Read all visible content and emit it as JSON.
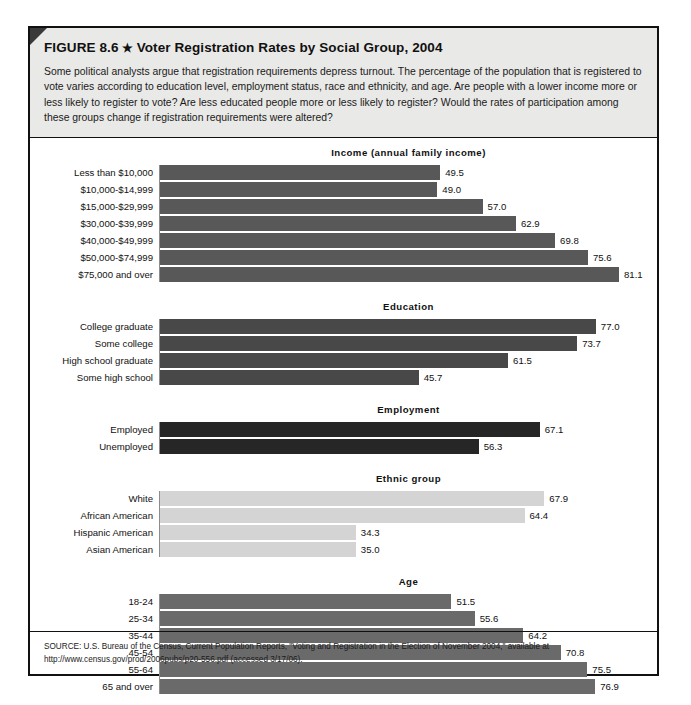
{
  "figure": {
    "label": "FIGURE 8.6",
    "star": "★",
    "title": "Voter Registration Rates by Social Group, 2004",
    "caption": "Some political analysts argue that registration requirements depress turnout. The percentage of the population that is registered to vote varies according to education level, employment status, race and ethnicity, and age. Are people with a lower income more or less likely to register to vote? Are less educated people more or less likely to register? Would the rates of participation among these groups change if registration requirements were altered?",
    "source": "SOURCE: U.S. Bureau of the Census, Current Population Reports, \"Voting and Registration in the Election of November 2004,\" available at http://www.census.gov/prod/2006pubs/p20-556.pdf (accessed 3/17/06)."
  },
  "colors": {
    "income_bar": "#585858",
    "education_bar": "#484848",
    "employment_bar": "#262626",
    "ethnic_bar": "#d4d4d4",
    "age_bar": "#6a6a6a",
    "header_bg": "#e9e9e7",
    "border": "#111111",
    "axis": "#8d8d8d"
  },
  "chart_data": {
    "type": "bar",
    "title": "Voter Registration Rates by Social Group, 2004",
    "xlabel": "",
    "ylabel": "",
    "xlim": [
      0,
      100
    ],
    "grid": false,
    "orientation": "horizontal",
    "value_unit": "percent",
    "groups": [
      {
        "name": "Income (annual family income)",
        "categories": [
          "Less than $10,000",
          "$10,000-$14,999",
          "$15,000-$29,999",
          "$30,000-$39,999",
          "$40,000-$49,999",
          "$50,000-$74,999",
          "$75,000 and over"
        ],
        "values": [
          49.5,
          49.0,
          57.0,
          62.9,
          69.8,
          75.6,
          81.1
        ],
        "labels": [
          "49.5",
          "49.0",
          "57.0",
          "62.9",
          "69.8",
          "75.6",
          "81.1"
        ],
        "color": "#585858"
      },
      {
        "name": "Education",
        "categories": [
          "College graduate",
          "Some college",
          "High school graduate",
          "Some high school"
        ],
        "values": [
          77.0,
          73.7,
          61.5,
          45.7
        ],
        "labels": [
          "77.0",
          "73.7",
          "61.5",
          "45.7"
        ],
        "color": "#484848"
      },
      {
        "name": "Employment",
        "categories": [
          "Employed",
          "Unemployed"
        ],
        "values": [
          67.1,
          56.3
        ],
        "labels": [
          "67.1",
          "56.3"
        ],
        "color": "#262626"
      },
      {
        "name": "Ethnic group",
        "categories": [
          "White",
          "African American",
          "Hispanic American",
          "Asian American"
        ],
        "values": [
          67.9,
          64.4,
          34.3,
          35.0
        ],
        "labels": [
          "67.9",
          "64.4",
          "34.3",
          "35.0"
        ],
        "color": "#d4d4d4",
        "drawn_values": [
          67.9,
          64.4,
          34.6,
          34.6
        ]
      },
      {
        "name": "Age",
        "categories": [
          "18-24",
          "25-34",
          "35-44",
          "45-54",
          "55-64",
          "65 and over"
        ],
        "values": [
          51.5,
          55.6,
          64.2,
          70.8,
          75.5,
          76.9
        ],
        "labels": [
          "51.5",
          "55.6",
          "64.2",
          "70.8",
          "75.5",
          "76.9"
        ],
        "color": "#6a6a6a"
      }
    ]
  }
}
